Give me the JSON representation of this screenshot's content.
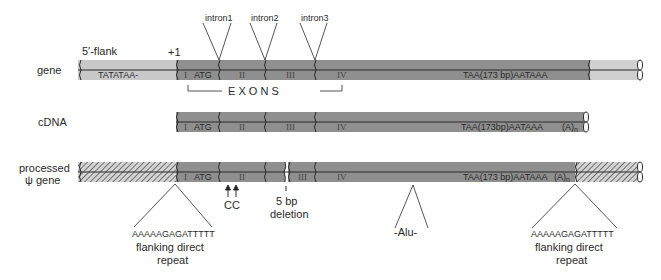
{
  "colors": {
    "exon_dark": "#8f8f8f",
    "flank_light": "#c8c8c8",
    "hatch_bg": "#d4d4d4",
    "hatch_line": "#555555",
    "line": "#2a2a2a",
    "text": "#2a2a2a"
  },
  "rows": {
    "gene": {
      "label": "gene",
      "flank5_label": "5′-flank",
      "start_label": "+1",
      "tata": "TATATAA-",
      "exon_labels": [
        "I",
        "ATG",
        "II",
        "III",
        "IV"
      ],
      "tail_seq": "TAA(173 bp)AATAAA"
    },
    "cdna": {
      "label": "cDNA",
      "exon_labels": [
        "I",
        "ATG",
        "II",
        "III",
        "IV"
      ],
      "tail_seq": "TAA(173bp)AATAAA",
      "polyA": "(A)",
      "polyA_sub": "n"
    },
    "pseudo": {
      "label_line1": "processed",
      "label_line2": "ψ gene",
      "exon_labels": [
        "I",
        "ATG",
        "II",
        "III",
        "IV"
      ],
      "tail_seq": "TAA(173 bp)AATAAA",
      "polyA": "(A)",
      "polyA_sub": "n"
    }
  },
  "introns": [
    "intron1",
    "intron2",
    "intron3"
  ],
  "exons_bracket_label": "E X O N S",
  "annotations": {
    "cc_label": "CC",
    "deletion_line1": "5 bp",
    "deletion_line2": "deletion",
    "alu_label": "-Alu-",
    "left_repeat_seq": "AAAAAGAGATTTTT",
    "left_repeat_line1": "flanking direct",
    "left_repeat_line2": "repeat",
    "right_repeat_seq": "AAAAAGAGATTTTT",
    "right_repeat_line1": "flanking direct",
    "right_repeat_line2": "repeat"
  }
}
